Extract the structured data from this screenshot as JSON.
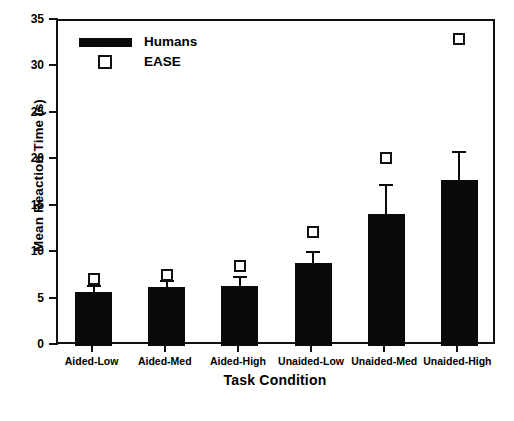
{
  "chart_data": {
    "type": "bar",
    "title": "",
    "xlabel": "Task Condition",
    "ylabel": "Mean Reaction Time (s)",
    "ylim": [
      0,
      35
    ],
    "yticks": [
      0,
      5,
      10,
      15,
      20,
      25,
      30,
      35
    ],
    "ytick_labels": [
      "0",
      "5",
      "10",
      "15",
      "20",
      "25",
      "30",
      "35"
    ],
    "grid": false,
    "legend_position": "top-left",
    "categories": [
      "Aided-Low",
      "Aided-Med",
      "Aided-High",
      "Unaided-Low",
      "Unaided-Med",
      "Unaided-High"
    ],
    "series": [
      {
        "name": "Humans",
        "type": "bar",
        "color": "#0a0a0a",
        "values": [
          5.8,
          6.4,
          6.5,
          8.9,
          14.2,
          17.9
        ],
        "error_upper": [
          0.8,
          0.7,
          1.0,
          1.3,
          3.2,
          3.1
        ],
        "error_bar_tops": [
          6.6,
          7.1,
          7.5,
          10.2,
          17.4,
          21.0
        ]
      },
      {
        "name": "EASE",
        "type": "scatter",
        "marker": "open-square",
        "color": "#ffffff",
        "edge_color": "#111111",
        "values": [
          7.2,
          7.7,
          8.6,
          12.3,
          20.3,
          33.1
        ]
      }
    ]
  },
  "legend": {
    "items": [
      {
        "label": "Humans",
        "swatch": "filled-bar-swatch"
      },
      {
        "label": "EASE",
        "swatch": "open-square-swatch"
      }
    ]
  }
}
